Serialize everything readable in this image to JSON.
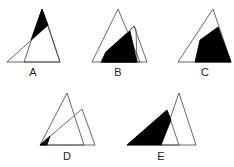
{
  "figure": {
    "options": [
      {
        "label": "A",
        "shaded": "upper tip of tall triangle above the slanted triangle"
      },
      {
        "label": "B",
        "shaded": "intersection of the two triangles (large)"
      },
      {
        "label": "C",
        "shaded": "right slanted triangle region below its apex"
      },
      {
        "label": "D",
        "shaded": "small sliver at bottom-left where triangles meet"
      },
      {
        "label": "E",
        "shaded": "left slanted triangle outside the upright triangle"
      }
    ]
  },
  "colors": {
    "stroke": "#333333",
    "fill": "#000000",
    "background": "#ffffff"
  }
}
